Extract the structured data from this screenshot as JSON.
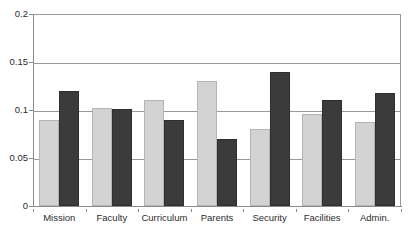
{
  "chart_data": {
    "type": "bar",
    "title": "",
    "subtitle": "",
    "xlabel": "",
    "ylabel": "",
    "categories": [
      "Mission",
      "Faculty",
      "Curriculum",
      "Parents",
      "Security",
      "Facilities",
      "Admin."
    ],
    "series": [
      {
        "name": "series-1",
        "color": "#d3d3d3",
        "values": [
          0.09,
          0.102,
          0.11,
          0.13,
          0.08,
          0.096,
          0.087
        ]
      },
      {
        "name": "series-2",
        "color": "#3b3b3b",
        "values": [
          0.12,
          0.101,
          0.09,
          0.07,
          0.14,
          0.11,
          0.118
        ]
      }
    ],
    "ylim": [
      0,
      0.2
    ],
    "yticks": [
      0,
      0.05,
      0.1,
      0.15,
      0.2
    ],
    "ytick_labels": [
      "0",
      "0.05",
      "0.1",
      "0.15",
      "0.2"
    ],
    "grid": "horizontal",
    "legend": "none",
    "legend_position": "none",
    "annotations": []
  },
  "axes": {
    "y_axis_color": "#8a8a8a",
    "x_axis_color": "#8a8a8a",
    "gridline_color": "#9a9a9a",
    "label_color": "#2b2b2b"
  }
}
